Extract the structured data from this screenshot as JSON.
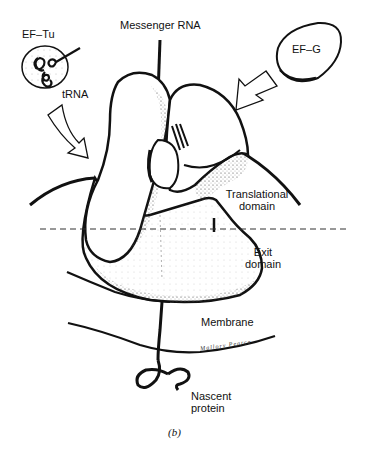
{
  "figure": {
    "caption": "(b)",
    "signature": "Mallory Pearce"
  },
  "labels": {
    "ef_tu": "EF–Tu",
    "trna": "tRNA",
    "messenger_rna": "Messenger RNA",
    "ef_g": "EF–G",
    "translational_domain_line1": "Translational",
    "translational_domain_line2": "domain",
    "exit_domain_line1": "Exit",
    "exit_domain_line2": "domain",
    "membrane": "Membrane",
    "nascent_protein_line1": "Nascent",
    "nascent_protein_line2": "protein"
  },
  "colors": {
    "ink": "#111111",
    "background": "#ffffff",
    "shade": "#555555"
  }
}
